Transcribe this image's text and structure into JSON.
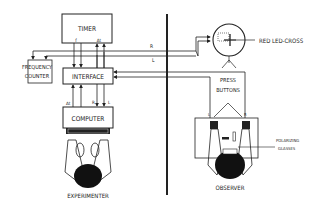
{
  "diagram": {
    "blocks": {
      "timer": "TIMER",
      "interface": "INTERFACE",
      "computer": "COMPUTER",
      "frequency_counter_line1": "FREQUENCY",
      "frequency_counter_line2": "COUNTER",
      "press_buttons_line1": "PRESS",
      "press_buttons_line2": "BUTTONS"
    },
    "signals": {
      "timer_f": "f",
      "timer_dt": "Δt",
      "computer_dt": "Δt",
      "computer_r": "R",
      "computer_l": "L",
      "line_r": "R",
      "line_l": "L",
      "button_l": "L",
      "button_r": "R"
    },
    "labels": {
      "red_led_cross": "RED LED-CROSS",
      "polarizing_line1": "POLARIZING",
      "polarizing_line2": "GLASSES",
      "experimenter": "EXPERIMENTER",
      "observer": "OBSERVER"
    },
    "colors": {
      "ink": "#222222",
      "background": "#ffffff"
    }
  }
}
